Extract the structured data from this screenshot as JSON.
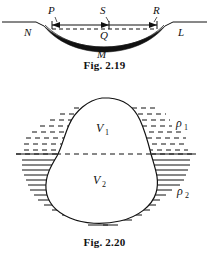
{
  "page": {
    "background_color": "#ffffff",
    "ink_color": "#111111",
    "width": 209,
    "height": 256
  },
  "figures": [
    {
      "id": "fig-2-19",
      "caption": "Fig. 2.19",
      "description": "Concave curved mirror surface on a ground line, with chord PR, sagitta markers and points labelled.",
      "labels": [
        {
          "name": "point-N",
          "text": "N",
          "x": 24,
          "y": 34
        },
        {
          "name": "point-P",
          "text": "P",
          "x": 51,
          "y": 13
        },
        {
          "name": "point-S",
          "text": "S",
          "x": 102,
          "y": 13
        },
        {
          "name": "point-R",
          "text": "R",
          "x": 155,
          "y": 13
        },
        {
          "name": "point-Q",
          "text": "Q",
          "x": 103,
          "y": 37
        },
        {
          "name": "point-L",
          "text": "L",
          "x": 180,
          "y": 34
        },
        {
          "name": "point-M",
          "text": "M",
          "x": 101,
          "y": 54
        }
      ]
    },
    {
      "id": "fig-2-20",
      "caption": "Fig. 2.20",
      "description": "Irregular solid body floating at the interface of two fluids; upper volume V1 in fluid of density rho1, lower volume V2 in fluid of density rho2.",
      "labels": [
        {
          "name": "volume-upper",
          "text": "V",
          "sub": "1",
          "x": 100,
          "y": 52
        },
        {
          "name": "volume-lower",
          "text": "V",
          "sub": "2",
          "x": 97,
          "y": 104
        },
        {
          "name": "density-upper",
          "text": "ρ",
          "sub": "1",
          "x": 180,
          "y": 47
        },
        {
          "name": "density-lower",
          "text": "ρ",
          "sub": "2",
          "x": 181,
          "y": 115
        }
      ],
      "interface_line_y": 78,
      "upper_fluid_hatch": "dashed-horizontal",
      "lower_fluid_hatch": "solid-horizontal"
    }
  ]
}
